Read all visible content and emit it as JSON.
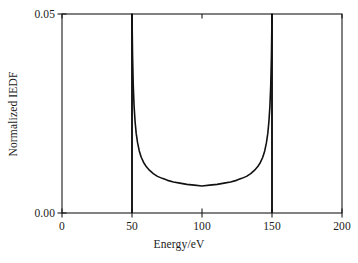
{
  "chart_data": {
    "type": "line",
    "title": "",
    "xlabel": "Energy/eV",
    "ylabel": "Normalized IEDF",
    "xlim": [
      0,
      200
    ],
    "ylim": [
      0.0,
      0.05
    ],
    "xticks": [
      0,
      50,
      100,
      150,
      200
    ],
    "xtick_labels": [
      "0",
      "50",
      "100",
      "150",
      "200"
    ],
    "yticks": [
      0.0,
      0.05
    ],
    "ytick_labels": [
      "0.00",
      "0.05"
    ],
    "grid": false,
    "legend": null,
    "frame": "box",
    "line_color": "#111111",
    "series": [
      {
        "name": "Normalized IEDF",
        "color": "#111111",
        "x": [
          50.0,
          50.4,
          50.9,
          51.5,
          52.2,
          53.0,
          54.0,
          55.2,
          56.6,
          58.3,
          60.3,
          62.6,
          65.2,
          68.2,
          71.6,
          75.4,
          79.6,
          84.2,
          89.2,
          94.5,
          100.0,
          105.5,
          110.8,
          115.8,
          120.4,
          124.6,
          128.4,
          131.8,
          134.8,
          137.4,
          139.7,
          141.7,
          143.4,
          144.8,
          146.0,
          147.0,
          147.8,
          148.5,
          149.1,
          149.6,
          150.0
        ],
        "y": [
          0.05,
          0.0395,
          0.032,
          0.0268,
          0.023,
          0.02,
          0.0176,
          0.0156,
          0.014,
          0.0127,
          0.0116,
          0.0107,
          0.0099,
          0.0092,
          0.0087,
          0.0082,
          0.0078,
          0.0075,
          0.0072,
          0.007,
          0.0068,
          0.007,
          0.0072,
          0.0075,
          0.0078,
          0.0082,
          0.0087,
          0.0092,
          0.0099,
          0.0107,
          0.0116,
          0.0127,
          0.014,
          0.0156,
          0.0176,
          0.02,
          0.023,
          0.0268,
          0.032,
          0.0395,
          0.05
        ]
      }
    ],
    "peaks": [
      {
        "name": "low-energy-peak",
        "x": 50,
        "y": 0.05
      },
      {
        "name": "high-energy-peak",
        "x": 150,
        "y": 0.05
      }
    ],
    "minimum": {
      "x": 100,
      "y": 0.0068
    }
  }
}
